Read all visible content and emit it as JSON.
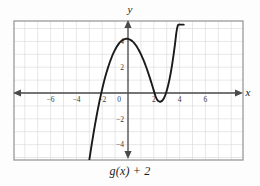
{
  "caption": "g(x) + 2",
  "colors": {
    "background": "#fdfdfd",
    "grid": "#d5d5d5",
    "frame": "#8a8a8a",
    "axis": "#4a4a4a",
    "curve": "#1a1a1a",
    "text": "#2b2b2b"
  },
  "axes": {
    "x_name": "x",
    "y_name": "y",
    "origin_label": "0"
  },
  "chart_data": {
    "type": "line",
    "title": "g(x) + 2",
    "xlabel": "x",
    "ylabel": "y",
    "grid": true,
    "legend": false,
    "xlim": [
      -7.5,
      8.0
    ],
    "ylim": [
      -5.4,
      5.4
    ],
    "xticks": [
      -6,
      -4,
      -2,
      0,
      2,
      4,
      6
    ],
    "xtick_labels": [
      "−6",
      "−4",
      "−2",
      "0",
      "2",
      "4",
      "6"
    ],
    "yticks": [
      -4,
      -2,
      2,
      4
    ],
    "ytick_labels": [
      "−4",
      "−2",
      "2",
      "4"
    ],
    "grid_step": 1,
    "annotations": [
      {
        "label": "local maximum",
        "x": -0.55,
        "y": 4.6
      },
      {
        "label": "local minimum",
        "x": 2.6,
        "y": -0.62
      },
      {
        "label": "x-intercept (left)",
        "x": -2.5,
        "y": 0
      },
      {
        "label": "x-intercept (middle)",
        "x": 1.75,
        "y": 0
      },
      {
        "label": "x-intercept (right)",
        "x": 3.35,
        "y": 0
      },
      {
        "label": "y-intercept",
        "x": 0,
        "y": 4.0
      }
    ],
    "series": [
      {
        "name": "g(x) + 2",
        "x": [
          -3.02,
          -2.95,
          -2.85,
          -2.75,
          -2.65,
          -2.55,
          -2.45,
          -2.35,
          -2.25,
          -2.15,
          -2.05,
          -1.95,
          -1.85,
          -1.75,
          -1.65,
          -1.55,
          -1.45,
          -1.35,
          -1.25,
          -1.15,
          -1.05,
          -0.95,
          -0.85,
          -0.75,
          -0.65,
          -0.55,
          -0.45,
          -0.35,
          -0.25,
          -0.15,
          -0.05,
          0.05,
          0.15,
          0.25,
          0.35,
          0.45,
          0.55,
          0.65,
          0.75,
          0.85,
          0.95,
          1.05,
          1.15,
          1.25,
          1.35,
          1.45,
          1.55,
          1.65,
          1.75,
          1.85,
          1.95,
          2.05,
          2.15,
          2.25,
          2.35,
          2.45,
          2.55,
          2.65,
          2.75,
          2.85,
          2.95,
          3.05,
          3.15,
          3.25,
          3.35,
          3.45,
          3.55,
          3.65,
          3.75,
          3.85,
          3.95,
          4.05,
          4.15,
          4.25,
          4.32
        ],
        "y": [
          -5.35,
          -4.87,
          -4.22,
          -3.59,
          -2.99,
          -2.41,
          -1.86,
          -1.33,
          -0.83,
          -0.36,
          0.09,
          0.52,
          0.92,
          1.29,
          1.64,
          1.97,
          2.27,
          2.55,
          2.81,
          3.05,
          3.26,
          3.45,
          3.62,
          3.77,
          3.9,
          4.0,
          4.08,
          4.14,
          4.18,
          4.2,
          4.2,
          4.18,
          4.14,
          4.08,
          4.0,
          3.9,
          3.78,
          3.64,
          3.48,
          3.3,
          3.11,
          2.9,
          2.67,
          2.43,
          2.17,
          1.9,
          1.61,
          1.31,
          1.0,
          0.68,
          0.35,
          0.02,
          -0.29,
          -0.5,
          -0.62,
          -0.67,
          -0.66,
          -0.6,
          -0.47,
          -0.27,
          0.0,
          0.34,
          0.75,
          1.23,
          1.78,
          2.4,
          3.09,
          3.85,
          4.68,
          5.2,
          5.3,
          5.3,
          5.3,
          5.3,
          5.3
        ]
      }
    ]
  },
  "geometry": {
    "frame": {
      "x": 14,
      "y": 21,
      "width": 229,
      "height": 139
    },
    "origin": {
      "x": 128,
      "y": 93
    },
    "unit_px": 12.9
  }
}
